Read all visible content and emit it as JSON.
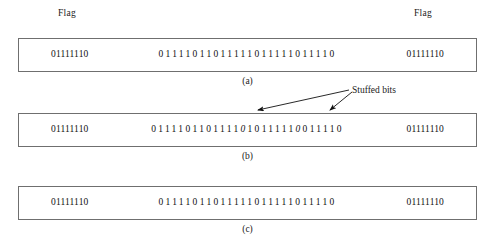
{
  "figure": {
    "flag_label_left": "Flag",
    "flag_label_right": "Flag",
    "annotation": "Stuffed bits",
    "flag_pattern": "01111110",
    "rows": [
      {
        "id": "a",
        "caption": "(a)",
        "flag_left": "01111110",
        "flag_right": "01111110",
        "payload": "01111011011111011111011110",
        "stuffed_positions": []
      },
      {
        "id": "b",
        "caption": "(b)",
        "flag_left": "01111110",
        "flag_right": "01111110",
        "payload": "0111101101111010111110011110",
        "stuffed_positions": [
          13,
          21
        ]
      },
      {
        "id": "c",
        "caption": "(c)",
        "flag_left": "01111110",
        "flag_right": "01111110",
        "payload": "01111011011111011111011110",
        "stuffed_positions": []
      }
    ]
  },
  "colors": {
    "frame_border": "#6f6f6f",
    "text": "#1a1a1a",
    "background": "#ffffff",
    "arrow": "#111111"
  }
}
